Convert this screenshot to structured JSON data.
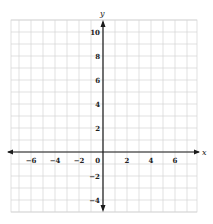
{
  "chart_data": {
    "type": "line",
    "title": "",
    "xlabel": "x",
    "ylabel": "y",
    "xlim": [
      -7.67,
      7.83
    ],
    "ylim": [
      -5,
      11
    ],
    "grid": true,
    "grid_step": 1,
    "x_ticks": [
      -6,
      -4,
      -2,
      0,
      2,
      4,
      6
    ],
    "x_tick_labels": [
      "−6",
      "−4",
      "−2",
      "0",
      "2",
      "4",
      "6"
    ],
    "y_ticks": [
      10,
      8,
      6,
      4,
      2,
      -2,
      -4
    ],
    "y_tick_labels": [
      "10",
      "8",
      "6",
      "4",
      "2",
      "−2",
      "−4"
    ],
    "series": []
  },
  "layout": {
    "origin_px": [
      103,
      152
    ],
    "unit_px": 12,
    "grid_left": 11,
    "grid_right": 197,
    "grid_top": 20,
    "grid_bottom": 212,
    "grid_color": "#d4d4d4",
    "axis_color": "#1a1a1a"
  }
}
